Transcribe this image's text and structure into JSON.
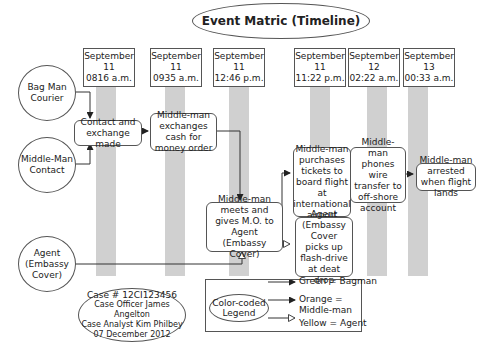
{
  "title": "Event Matric (Timeline)",
  "timeline": [
    {
      "date": "September 11",
      "time": "0816 a.m."
    },
    {
      "date": "September 11",
      "time": "0935 a.m."
    },
    {
      "date": "September 11",
      "time": "12:46 p.m."
    },
    {
      "date": "September 11",
      "time": "11:22 p.m."
    },
    {
      "date": "September 12",
      "time": "02:22 a.m."
    },
    {
      "date": "September 13",
      "time": "00:33 a.m."
    }
  ],
  "actors": [
    {
      "label": "Bag Man Courier"
    },
    {
      "label": "Middle-Man Contact"
    },
    {
      "label": "Agent (Embassy Cover)"
    }
  ],
  "events": [
    {
      "label": "Contact and exchange made"
    },
    {
      "label": "Middle-man exchanges cash for money order"
    },
    {
      "label": "Middle-man meets and gives M.O. to Agent (Embassy Cover)"
    },
    {
      "label": "Middle-man purchases tickets to board flight at international airport"
    },
    {
      "label": "Agent (Embassy Cover picks up flash-drive at deat drop"
    },
    {
      "label": "Middle-man phones wire transfer to off-shore account"
    },
    {
      "label": "Middle-man arrested when flight lands"
    }
  ],
  "case_info": {
    "case_number": "Case # 12CI123456",
    "officer": "Case Officer James Angelton",
    "analyst": "Case Analyst Kim Philbey",
    "date": "07 December 2012"
  },
  "legend": {
    "title": "Color-coded Legend",
    "entries": [
      {
        "label": "Green = Bagman",
        "arrow": "filled-black"
      },
      {
        "label": "Orange = Middle-man",
        "arrow": "filled-black"
      },
      {
        "label": "Yellow = Agent",
        "arrow": "hollow"
      }
    ]
  }
}
